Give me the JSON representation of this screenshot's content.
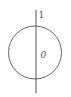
{
  "diagram": {
    "type": "circle-with-axis",
    "labels": {
      "axis_top": "1",
      "inside": "0"
    },
    "colors": {
      "stroke": "#555555",
      "background": "#ffffff"
    }
  }
}
